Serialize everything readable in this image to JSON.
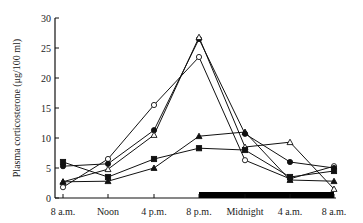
{
  "chart_data": {
    "type": "line",
    "title": "",
    "xlabel": "",
    "ylabel": "Plasma corticosterone (μg/100 ml)",
    "ylim": [
      0,
      30
    ],
    "yticks": [
      0,
      5,
      10,
      15,
      20,
      25,
      30
    ],
    "categories": [
      "8 a.m.",
      "Noon",
      "4 p.m.",
      "8 p.m.",
      "Midnight",
      "4 a.m.",
      "8 a.m."
    ],
    "dark_period": {
      "from": "8 p.m.",
      "to": "8 a.m.",
      "color": "#000000"
    },
    "grid": false,
    "legend": null,
    "series": [
      {
        "name": "open-circle",
        "marker": "circle",
        "filled": false,
        "values": [
          1.8,
          6.5,
          15.5,
          23.5,
          6.3,
          3.2,
          5.3
        ]
      },
      {
        "name": "filled-circle",
        "marker": "circle",
        "filled": true,
        "values": [
          5.3,
          5.7,
          11.3,
          26.5,
          10.7,
          6.0,
          5.0
        ]
      },
      {
        "name": "open-triangle",
        "marker": "triangle",
        "filled": false,
        "values": [
          2.7,
          4.8,
          10.5,
          26.8,
          8.5,
          9.3,
          1.5
        ]
      },
      {
        "name": "filled-triangle",
        "marker": "triangle",
        "filled": true,
        "values": [
          2.7,
          2.8,
          5.0,
          10.3,
          11.0,
          3.0,
          2.8
        ]
      },
      {
        "name": "filled-square",
        "marker": "square",
        "filled": true,
        "values": [
          6.0,
          3.5,
          6.5,
          8.3,
          8.0,
          3.5,
          4.5
        ]
      }
    ]
  }
}
